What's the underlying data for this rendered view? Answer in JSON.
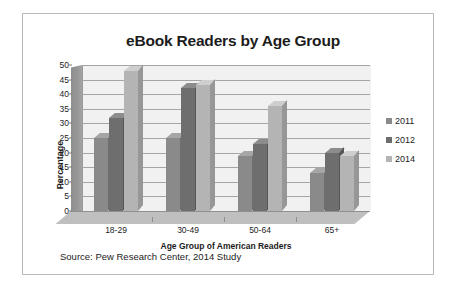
{
  "chart_data": {
    "type": "bar",
    "title": "eBook Readers by Age Group",
    "xlabel": "Age Group of American Readers",
    "ylabel": "Percentage",
    "categories": [
      "18-29",
      "30-49",
      "50-64",
      "65+"
    ],
    "series": [
      {
        "name": "2011",
        "values": [
          25,
          25,
          19,
          13
        ],
        "color": "#8a8a8a"
      },
      {
        "name": "2012",
        "values": [
          32,
          42,
          23,
          20
        ],
        "color": "#6e6e6e"
      },
      {
        "name": "2014",
        "values": [
          48,
          43,
          36,
          19
        ],
        "color": "#b4b4b4"
      }
    ],
    "ylim": [
      0,
      50
    ],
    "yticks": [
      0,
      5,
      10,
      15,
      20,
      25,
      30,
      35,
      40,
      45,
      50
    ],
    "ytick_labels": [
      "0",
      "5",
      "10",
      "15",
      "20",
      "25",
      "30",
      "35",
      "40",
      "45",
      "50"
    ],
    "grid": true,
    "legend_position": "right",
    "style": "3d-clustered-column"
  },
  "source": {
    "text": "Source: Pew Research Center, 2014 Study"
  },
  "legend": {
    "items": [
      {
        "label": "2011"
      },
      {
        "label": "2012"
      },
      {
        "label": "2014"
      }
    ]
  }
}
